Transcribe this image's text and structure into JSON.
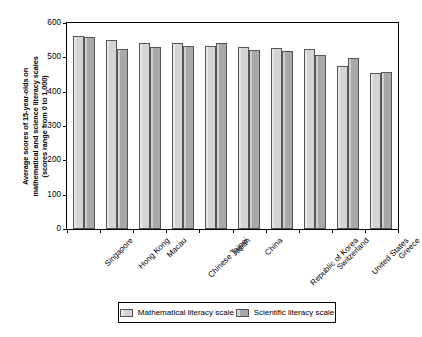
{
  "chart_data": {
    "type": "bar",
    "title": "",
    "xlabel": "",
    "ylabel": "Average scores of 15-year-olds on mathematical and science literacy scales (scores range from 0 to 1,000)",
    "ylabel_line1": "Average scores of 15-year-olds on",
    "ylabel_line2": "mathematical and science literacy scales",
    "ylabel_line3": "(scores range from 0 to 1,000)",
    "ylim": [
      0,
      600
    ],
    "yticks": [
      0,
      100,
      200,
      300,
      400,
      500,
      600
    ],
    "ytick_labels": [
      "0",
      "100",
      "200",
      "300",
      "400",
      "500",
      "600"
    ],
    "grid": false,
    "legend_position": "bottom",
    "categories": [
      "Singapore",
      "Hong Kong",
      "Macau",
      "Chinese Taipei",
      "Japan",
      "China",
      "Republic of Korea",
      "Switzerland",
      "United States",
      "Greece"
    ],
    "series": [
      {
        "name": "Mathematical  literacy scale",
        "color": "#d4d4d4",
        "values": [
          562,
          550,
          543,
          541,
          534,
          531,
          528,
          525,
          474,
          455
        ]
      },
      {
        "name": "Scientific literacy scale",
        "color": "#a8a8a8",
        "values": [
          558,
          523,
          530,
          534,
          541,
          520,
          518,
          508,
          499,
          456
        ]
      }
    ]
  },
  "legend": {
    "items": [
      {
        "label": "Mathematical  literacy scale"
      },
      {
        "label": "Scientific literacy scale"
      }
    ]
  },
  "colors": {
    "math_scale": "#d4d4d4",
    "science_scale": "#a8a8a8",
    "axis": "#000000",
    "background": "#ffffff"
  }
}
